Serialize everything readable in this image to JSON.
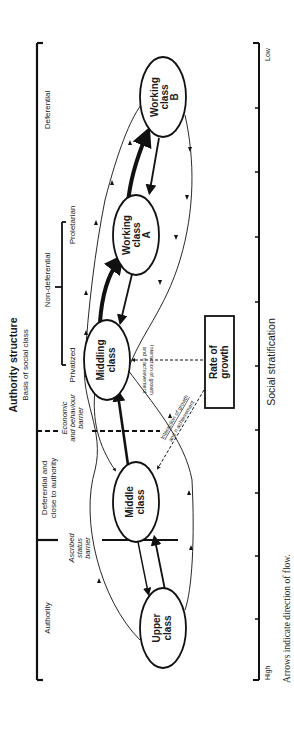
{
  "figure": {
    "orientation": "rotated-90-ccw",
    "caption": "Arrows indicate direction of flow."
  },
  "authority_axis": {
    "title": "Authority structure",
    "subtitle": "Basis of social class",
    "segments": [
      {
        "label": "Authority"
      },
      {
        "label_line1": "Deferential and",
        "label_line2": "close to authority"
      },
      {
        "label": "Privatized"
      },
      {
        "label": "Non-deferential"
      },
      {
        "label": "Proletarian"
      },
      {
        "label": "Deferential"
      }
    ],
    "barriers": [
      {
        "line1": "Ascribed",
        "line2": "status",
        "line3": "barrier",
        "style": "solid"
      },
      {
        "line1": "Economic",
        "line2": "and behaviour",
        "line3": "barrier",
        "style": "dashed"
      }
    ]
  },
  "stratification_axis": {
    "title": "Social stratification",
    "high_label": "High",
    "low_label": "Low",
    "tick_count": 7
  },
  "nodes": [
    {
      "id": "upper",
      "line1": "Upper",
      "line2": "class"
    },
    {
      "id": "middle",
      "line1": "Middle",
      "line2": "class"
    },
    {
      "id": "middling",
      "line1": "Middling",
      "line2": "class"
    },
    {
      "id": "workingA",
      "line1": "Working",
      "line2": "class",
      "line3": "A"
    },
    {
      "id": "workingB",
      "line1": "Working",
      "line2": "class",
      "line3": "B"
    }
  ],
  "rate_box": {
    "line1": "Rate of",
    "line2": "growth"
  },
  "interaction_labels": [
    {
      "line1": "Interaction of growth",
      "line2": "and n achievement"
    },
    {
      "line1": "Interaction of growth",
      "line2": "and n achievement"
    }
  ],
  "colors": {
    "ink": "#111111",
    "background": "#ffffff"
  }
}
